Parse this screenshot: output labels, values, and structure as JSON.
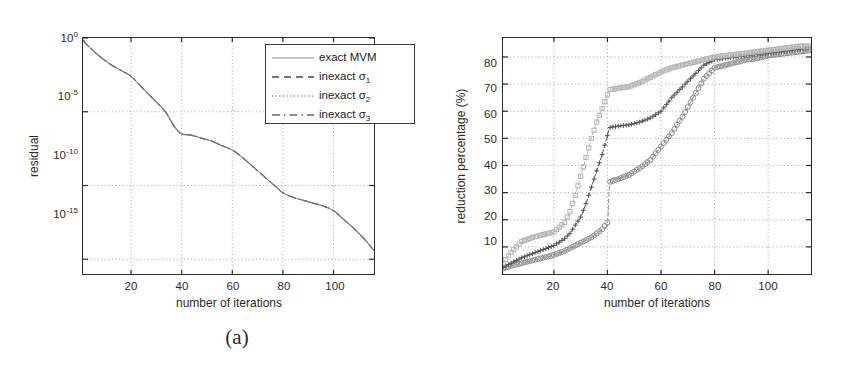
{
  "figure": {
    "panels": [
      {
        "id": "a",
        "caption": "(a)",
        "xlabel": "number of iterations",
        "ylabel": "residual",
        "xticks": [
          "20",
          "40",
          "60",
          "80",
          "100"
        ],
        "xtick_values": [
          20,
          40,
          60,
          80,
          100
        ],
        "yticks": [
          {
            "mantissa": "10",
            "exponent": "0"
          },
          {
            "mantissa": "10",
            "exponent": "-5"
          },
          {
            "mantissa": "10",
            "exponent": "-10"
          },
          {
            "mantissa": "10",
            "exponent": "-15"
          }
        ],
        "legend": [
          {
            "label": "exact MVM",
            "style": "solid",
            "marker": "none"
          },
          {
            "label": "inexact",
            "sub": "1",
            "symbol": "σ",
            "style": "dashed",
            "marker": "none"
          },
          {
            "label": "inexact",
            "sub": "2",
            "symbol": "σ",
            "style": "dotted",
            "marker": "none"
          },
          {
            "label": "inexact",
            "sub": "3",
            "symbol": "σ",
            "style": "dashdot",
            "marker": "none"
          }
        ]
      },
      {
        "id": "b",
        "caption": "(b)",
        "xlabel": "number of iterations",
        "ylabel": "reduction percentage (%)",
        "xticks": [
          "20",
          "40",
          "60",
          "80",
          "100"
        ],
        "xtick_values": [
          20,
          40,
          60,
          80,
          100
        ],
        "yticks": [
          "10",
          "20",
          "30",
          "40",
          "50",
          "60",
          "70",
          "80"
        ],
        "ytick_values": [
          10,
          20,
          30,
          40,
          50,
          60,
          70,
          80
        ],
        "legend": [
          {
            "symbol": "σ",
            "sub": "1",
            "style": "dashed",
            "marker": "circle"
          },
          {
            "symbol": "σ",
            "sub": "2",
            "style": "dashed",
            "marker": "plus"
          },
          {
            "symbol": "σ",
            "sub": "3",
            "style": "dashed",
            "marker": "square"
          }
        ]
      }
    ]
  },
  "colors": {
    "axis": "#2b2b2b",
    "grid": "#9a9a9a",
    "curve_a": "#6e6e6e",
    "sigma1": "#8c8c8c",
    "sigma2": "#555555",
    "sigma3": "#b4b4b4",
    "background": "#ffffff"
  },
  "chart_data": [
    {
      "type": "line",
      "panel": "a",
      "title": "",
      "xlabel": "number of iterations",
      "ylabel": "residual",
      "xlim": [
        1,
        116
      ],
      "ylim_log10": [
        -16,
        0
      ],
      "yscale": "log",
      "grid": true,
      "legend_position": "top-right",
      "note": "All four curves (exact MVM and inexact sigma_1..3) lie essentially on top of one another",
      "x": [
        1,
        4,
        8,
        12,
        16,
        20,
        24,
        28,
        32,
        34,
        36,
        38,
        40,
        44,
        48,
        52,
        56,
        60,
        64,
        68,
        72,
        76,
        78,
        80,
        84,
        88,
        92,
        96,
        100,
        104,
        108,
        112,
        116
      ],
      "series": [
        {
          "name": "exact MVM",
          "y_log10": [
            -0.15,
            -0.7,
            -1.3,
            -1.8,
            -2.2,
            -2.6,
            -3.3,
            -4.0,
            -4.7,
            -5.1,
            -5.7,
            -6.2,
            -6.5,
            -6.6,
            -6.8,
            -7.0,
            -7.3,
            -7.6,
            -8.1,
            -8.7,
            -9.3,
            -9.9,
            -10.2,
            -10.5,
            -10.8,
            -11.0,
            -11.2,
            -11.4,
            -11.7,
            -12.3,
            -12.9,
            -13.6,
            -14.4
          ]
        },
        {
          "name": "inexact σ_1",
          "y_log10": [
            -0.15,
            -0.7,
            -1.3,
            -1.8,
            -2.2,
            -2.6,
            -3.3,
            -4.0,
            -4.7,
            -5.1,
            -5.7,
            -6.2,
            -6.5,
            -6.6,
            -6.8,
            -7.0,
            -7.3,
            -7.6,
            -8.1,
            -8.7,
            -9.3,
            -9.9,
            -10.2,
            -10.5,
            -10.8,
            -11.0,
            -11.2,
            -11.4,
            -11.7,
            -12.3,
            -12.9,
            -13.6,
            -14.4
          ]
        },
        {
          "name": "inexact σ_2",
          "y_log10": [
            -0.15,
            -0.7,
            -1.3,
            -1.8,
            -2.2,
            -2.6,
            -3.3,
            -4.0,
            -4.7,
            -5.1,
            -5.7,
            -6.2,
            -6.5,
            -6.6,
            -6.8,
            -7.0,
            -7.3,
            -7.6,
            -8.1,
            -8.7,
            -9.3,
            -9.9,
            -10.2,
            -10.5,
            -10.8,
            -11.0,
            -11.2,
            -11.4,
            -11.7,
            -12.3,
            -12.9,
            -13.6,
            -14.4
          ]
        },
        {
          "name": "inexact σ_3",
          "y_log10": [
            -0.15,
            -0.7,
            -1.3,
            -1.8,
            -2.2,
            -2.6,
            -3.3,
            -4.0,
            -4.7,
            -5.1,
            -5.7,
            -6.2,
            -6.5,
            -6.6,
            -6.8,
            -7.0,
            -7.3,
            -7.6,
            -8.1,
            -8.7,
            -9.3,
            -9.9,
            -10.2,
            -10.5,
            -10.8,
            -11.0,
            -11.2,
            -11.4,
            -11.7,
            -12.3,
            -12.9,
            -13.6,
            -14.4
          ]
        }
      ]
    },
    {
      "type": "line",
      "panel": "b",
      "title": "",
      "xlabel": "number of iterations",
      "ylabel": "reduction percentage (%)",
      "xlim": [
        1,
        116
      ],
      "ylim": [
        0,
        87
      ],
      "grid": true,
      "legend_position": "right",
      "x": [
        1,
        4,
        8,
        12,
        16,
        20,
        24,
        26,
        28,
        30,
        32,
        34,
        36,
        38,
        40,
        41,
        44,
        48,
        52,
        56,
        60,
        64,
        68,
        72,
        76,
        80,
        84,
        88,
        92,
        96,
        100,
        104,
        108,
        112,
        116
      ],
      "series": [
        {
          "name": "σ_1",
          "marker": "circle",
          "values": [
            2,
            3,
            4,
            5,
            6,
            7,
            8.5,
            9.5,
            10.5,
            11.5,
            12.5,
            13.5,
            15,
            16.5,
            19,
            34,
            35,
            36.5,
            39,
            42,
            47,
            52,
            58,
            65,
            72,
            76,
            77,
            78,
            79,
            79.5,
            80.5,
            81,
            81.5,
            82,
            82.5
          ]
        },
        {
          "name": "σ_2",
          "marker": "plus",
          "values": [
            2.5,
            4,
            6,
            7.5,
            9,
            10.5,
            13,
            15,
            18,
            21,
            26,
            32,
            38,
            44,
            51,
            54,
            54.5,
            55,
            56,
            57.5,
            60,
            65,
            69,
            73,
            77,
            79,
            79.5,
            80,
            80.5,
            81,
            81.5,
            82,
            82.5,
            83,
            83.5
          ]
        },
        {
          "name": "σ_3",
          "marker": "square",
          "values": [
            4,
            8,
            12,
            13.5,
            14.5,
            15.5,
            19,
            23,
            29,
            36,
            43,
            50,
            56,
            61,
            66,
            68,
            68.5,
            69,
            70.5,
            72.5,
            74.5,
            76,
            77,
            78,
            79,
            80,
            80.5,
            81,
            81.5,
            82,
            82.5,
            83,
            83.5,
            84,
            84
          ]
        }
      ]
    }
  ]
}
